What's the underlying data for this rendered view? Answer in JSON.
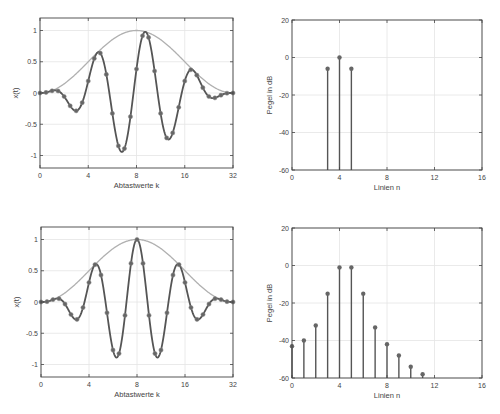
{
  "colors": {
    "signal": "#555555",
    "marker": "#666666",
    "envelope": "#b0b0b0",
    "grid": "#e4e4e4",
    "axis": "#444444",
    "stem": "#555555"
  },
  "chart_data": [
    {
      "id": "top-left",
      "type": "line",
      "title": "",
      "xlabel": "Abtastwerte k",
      "ylabel": "x(t)",
      "xlim": [
        0,
        32
      ],
      "ylim": [
        -1.2,
        1.2
      ],
      "xtick_positions": [
        0,
        8,
        16,
        24,
        32
      ],
      "xtick_labels": [
        "0",
        "4",
        "8",
        "16",
        "32"
      ],
      "ytick_values": [
        -1,
        -0.5,
        0,
        0.5,
        1
      ],
      "ytick_labels": [
        "-1",
        "-0.5",
        "0",
        "0.5",
        "1"
      ],
      "grid": true,
      "series": [
        {
          "name": "envelope",
          "model": "hann",
          "N": 32
        },
        {
          "name": "signal",
          "model": "hann*cos",
          "N": 32,
          "period": 8,
          "center": 17.5,
          "samples_k": [
            0,
            1,
            2,
            3,
            4,
            5,
            6,
            7,
            8,
            9,
            10,
            11,
            12,
            13,
            14,
            15,
            16,
            17,
            18,
            19,
            20,
            21,
            22,
            23,
            24,
            25,
            26,
            27,
            28,
            29,
            30,
            31,
            32
          ],
          "samples_x": [
            0.0,
            0.01,
            0.03,
            -0.0,
            -0.14,
            -0.26,
            -0.23,
            0.0,
            0.42,
            0.7,
            0.53,
            0.0,
            -0.65,
            -0.96,
            -0.72,
            0.0,
            0.71,
            0.97,
            0.68,
            0.0,
            -0.55,
            -0.7,
            -0.43,
            0.0,
            0.29,
            0.31,
            0.14,
            0.0,
            -0.06,
            -0.05,
            -0.01,
            0.0,
            0.0
          ]
        }
      ]
    },
    {
      "id": "top-right",
      "type": "stem",
      "xlabel": "Linien n",
      "ylabel": "Pegel in dB",
      "xlim": [
        0,
        16
      ],
      "ylim": [
        -60,
        20
      ],
      "xtick_values": [
        0,
        4,
        8,
        12,
        16
      ],
      "ytick_values": [
        -60,
        -40,
        -20,
        0,
        20
      ],
      "grid": true,
      "x": [
        3,
        4,
        5
      ],
      "values": [
        -6,
        0,
        -6
      ]
    },
    {
      "id": "bottom-left",
      "type": "line",
      "title": "",
      "xlabel": "Abtastwerte k",
      "ylabel": "x(t)",
      "xlim": [
        0,
        32
      ],
      "ylim": [
        -1.2,
        1.2
      ],
      "xtick_positions": [
        0,
        8,
        16,
        24,
        32
      ],
      "xtick_labels": [
        "0",
        "4",
        "8",
        "16",
        "32"
      ],
      "ytick_values": [
        -1,
        -0.5,
        0,
        0.5,
        1
      ],
      "ytick_labels": [
        "-1",
        "-0.5",
        "0",
        "0.5",
        "1"
      ],
      "grid": true,
      "series": [
        {
          "name": "envelope",
          "model": "hann",
          "N": 32
        },
        {
          "name": "signal",
          "model": "hann*cos",
          "N": 32,
          "period": 7,
          "center": 16,
          "samples_k": [
            0,
            1,
            2,
            3,
            4,
            5,
            6,
            7,
            8,
            9,
            10,
            11,
            12,
            13,
            14,
            15,
            16,
            17,
            18,
            19,
            20,
            21,
            22,
            23,
            24,
            25,
            26,
            27,
            28,
            29,
            30,
            31,
            32
          ],
          "samples_x": [
            0.0,
            0.01,
            0.04,
            -0.06,
            -0.2,
            -0.26,
            0.03,
            0.37,
            0.57,
            0.6,
            -0.0,
            -0.59,
            -0.86,
            -0.19,
            0.34,
            0.62,
            1.0,
            0.62,
            0.34,
            -0.19,
            -0.86,
            -0.59,
            -0.0,
            0.6,
            0.57,
            0.37,
            0.03,
            -0.26,
            -0.2,
            -0.06,
            0.04,
            0.01,
            0.0
          ]
        }
      ]
    },
    {
      "id": "bottom-right",
      "type": "stem",
      "xlabel": "Linien n",
      "ylabel": "Pegel in dB",
      "xlim": [
        0,
        16
      ],
      "ylim": [
        -60,
        20
      ],
      "xtick_values": [
        0,
        4,
        8,
        12,
        16
      ],
      "ytick_values": [
        -60,
        -40,
        -20,
        0,
        20
      ],
      "grid": true,
      "x": [
        0,
        1,
        2,
        3,
        4,
        5,
        6,
        7,
        8,
        9,
        10,
        11
      ],
      "values": [
        -43,
        -40,
        -32,
        -15,
        -1,
        -1,
        -15,
        -33,
        -42,
        -48,
        -54,
        -58
      ]
    }
  ],
  "panels": [
    {
      "chart": 0,
      "frame": {
        "left": 40,
        "top": 18,
        "width": 193,
        "height": 150
      }
    },
    {
      "chart": 1,
      "frame": {
        "left": 292,
        "top": 20,
        "width": 190,
        "height": 150
      }
    },
    {
      "chart": 2,
      "frame": {
        "left": 41,
        "top": 227,
        "width": 192,
        "height": 150
      }
    },
    {
      "chart": 3,
      "frame": {
        "left": 292,
        "top": 228,
        "width": 190,
        "height": 150
      }
    }
  ]
}
